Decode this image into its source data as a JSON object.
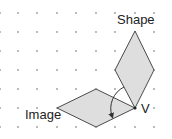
{
  "diagram": {
    "title": "",
    "labels": {
      "shape": "Shape",
      "image": "Image",
      "vertex": "V"
    },
    "grid": {
      "x": [
        0,
        18,
        37,
        57,
        76,
        96,
        115,
        135,
        154
      ],
      "y": [
        13,
        32,
        51,
        70,
        89,
        108,
        127
      ],
      "dot_color": "#9a9a9a"
    },
    "shape_polygon": "135,108 154,70 135,31 115,70",
    "image_polygon": "135,108 96,89 57,108 96,127",
    "fill_color": "#dedede",
    "stroke_color": "#4a4a4a",
    "rotation_arc": {
      "path": "M124,87 A24,24 0 0 0 112,116",
      "direction": "counterclockwise-to-image"
    }
  }
}
